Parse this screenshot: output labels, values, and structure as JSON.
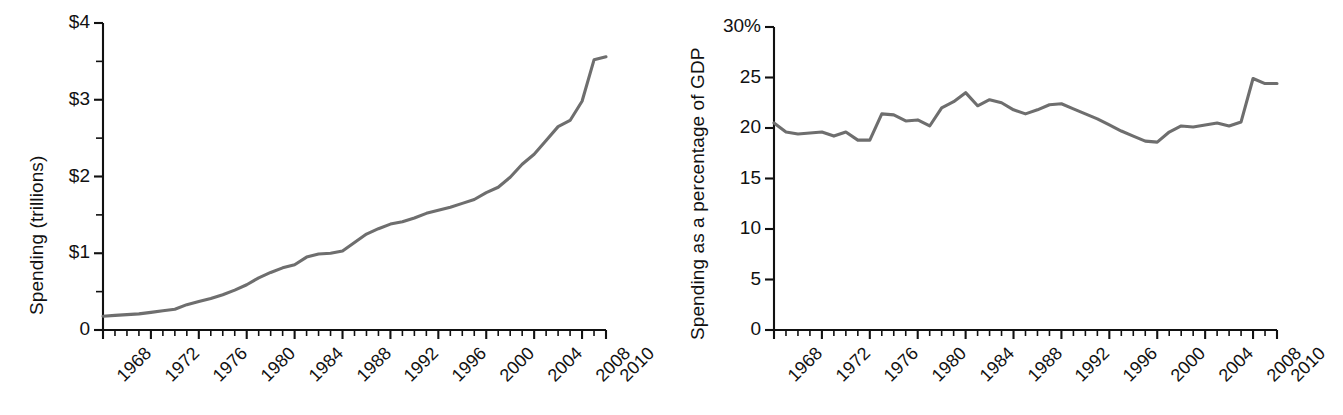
{
  "figure": {
    "background": "#ffffff",
    "line_color": "#6e6e6e",
    "axis_color": "#111111"
  },
  "panels": [
    {
      "id": "left",
      "ylabel": "Spending (trillions)",
      "ytick_labels": [
        "$4",
        "$3",
        "$2",
        "$1",
        "0"
      ],
      "xtick_labels": [
        "1968",
        "1972",
        "1976",
        "1980",
        "1984",
        "1988",
        "1992",
        "1996",
        "2000",
        "2004",
        "2008",
        "2010"
      ]
    },
    {
      "id": "right",
      "ylabel": "Spending as a percentage of GDP",
      "ytick_labels": [
        "30%",
        "25",
        "20",
        "15",
        "10",
        "5",
        "0"
      ],
      "xtick_labels": [
        "1968",
        "1972",
        "1976",
        "1980",
        "1984",
        "1988",
        "1992",
        "1996",
        "2000",
        "2004",
        "2008",
        "2010"
      ]
    }
  ],
  "chart_data": [
    {
      "type": "line",
      "title": "",
      "xlabel": "",
      "ylabel": "Spending (trillions)",
      "xlim": [
        1968,
        2010
      ],
      "ylim": [
        0,
        4
      ],
      "yticks": [
        0,
        0.5,
        1,
        1.5,
        2,
        2.5,
        3,
        3.5,
        4
      ],
      "ytick_labels": [
        "0",
        "",
        "$1",
        "",
        "$2",
        "",
        "$3",
        "",
        "$4"
      ],
      "xticks": [
        1968,
        1972,
        1976,
        1980,
        1984,
        1988,
        1992,
        1996,
        2000,
        2004,
        2008,
        2010
      ],
      "grid": false,
      "legend": null,
      "x": [
        1968,
        1969,
        1970,
        1971,
        1972,
        1973,
        1974,
        1975,
        1976,
        1977,
        1978,
        1979,
        1980,
        1981,
        1982,
        1983,
        1984,
        1985,
        1986,
        1987,
        1988,
        1989,
        1990,
        1991,
        1992,
        1993,
        1994,
        1995,
        1996,
        1997,
        1998,
        1999,
        2000,
        2001,
        2002,
        2003,
        2004,
        2005,
        2006,
        2007,
        2008,
        2009,
        2010
      ],
      "values": [
        0.18,
        0.19,
        0.2,
        0.21,
        0.23,
        0.25,
        0.27,
        0.33,
        0.37,
        0.41,
        0.46,
        0.52,
        0.59,
        0.68,
        0.75,
        0.81,
        0.85,
        0.95,
        0.99,
        1.0,
        1.03,
        1.14,
        1.25,
        1.32,
        1.38,
        1.41,
        1.46,
        1.52,
        1.56,
        1.6,
        1.65,
        1.7,
        1.79,
        1.86,
        1.99,
        2.16,
        2.29,
        2.47,
        2.65,
        2.73,
        2.98,
        3.52,
        3.56
      ]
    },
    {
      "type": "line",
      "title": "",
      "xlabel": "",
      "ylabel": "Spending as a percentage of GDP",
      "xlim": [
        1968,
        2010
      ],
      "ylim": [
        0,
        30
      ],
      "yticks": [
        0,
        5,
        10,
        15,
        20,
        25,
        30
      ],
      "ytick_labels": [
        "0",
        "5",
        "10",
        "15",
        "20",
        "25",
        "30%"
      ],
      "xticks": [
        1968,
        1972,
        1976,
        1980,
        1984,
        1988,
        1992,
        1996,
        2000,
        2004,
        2008,
        2010
      ],
      "grid": false,
      "legend": null,
      "x": [
        1968,
        1969,
        1970,
        1971,
        1972,
        1973,
        1974,
        1975,
        1976,
        1977,
        1978,
        1979,
        1980,
        1981,
        1982,
        1983,
        1984,
        1985,
        1986,
        1987,
        1988,
        1989,
        1990,
        1991,
        1992,
        1993,
        1994,
        1995,
        1996,
        1997,
        1998,
        1999,
        2000,
        2001,
        2002,
        2003,
        2004,
        2005,
        2006,
        2007,
        2008,
        2009,
        2010
      ],
      "values": [
        20.5,
        19.6,
        19.4,
        19.5,
        19.6,
        19.2,
        19.6,
        18.8,
        18.8,
        21.4,
        21.3,
        20.7,
        20.8,
        20.2,
        22.0,
        22.6,
        23.5,
        22.2,
        22.8,
        22.5,
        21.8,
        21.4,
        21.8,
        22.3,
        22.4,
        21.9,
        21.4,
        20.9,
        20.3,
        19.7,
        19.2,
        18.7,
        18.6,
        19.6,
        20.2,
        20.1,
        20.3,
        20.5,
        20.2,
        20.6,
        24.9,
        24.4,
        24.4
      ]
    }
  ]
}
